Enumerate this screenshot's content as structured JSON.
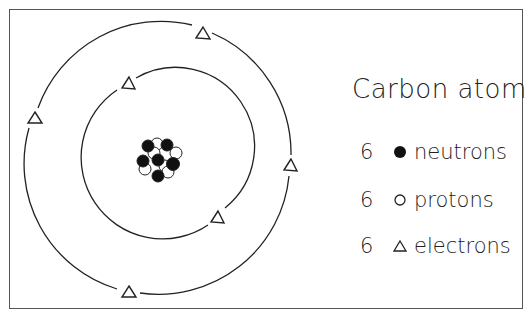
{
  "title": "Carbon atom",
  "legend": [
    {
      "count": "6",
      "symbol": "filled-circle",
      "label": "neutrons"
    },
    {
      "count": "6",
      "symbol": "open-circle",
      "label": "protons"
    },
    {
      "count": "6",
      "symbol": "triangle",
      "label": "electrons"
    }
  ],
  "diagram": {
    "nucleus": {
      "neutrons": 6,
      "protons": 6
    },
    "orbits": [
      {
        "name": "inner",
        "electrons": 2
      },
      {
        "name": "outer",
        "electrons": 4
      }
    ],
    "colors": {
      "stroke": "#222222",
      "fill_dark": "#111111",
      "background": "#ffffff"
    }
  }
}
